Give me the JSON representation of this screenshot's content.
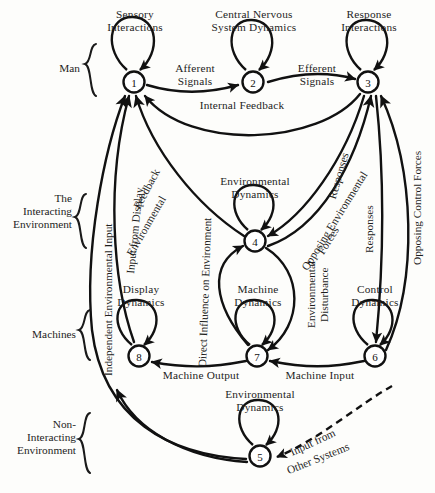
{
  "figure": {
    "type": "block-diagram",
    "background_color": "#fdfdfb",
    "line_color": "#111111"
  },
  "group_brackets": [
    {
      "id": "man",
      "label_lines": [
        "Man"
      ]
    },
    {
      "id": "interacting-environment",
      "label_lines": [
        "The",
        "Interacting",
        "Environment"
      ]
    },
    {
      "id": "machines",
      "label_lines": [
        "Machines"
      ]
    },
    {
      "id": "non-interacting-environment",
      "label_lines": [
        "Non-",
        "Interacting",
        "Environment"
      ]
    }
  ],
  "nodes": [
    {
      "id": 1,
      "number": "1",
      "title_lines": [
        "Sensory",
        "Interactions"
      ],
      "x": 134,
      "y": 82
    },
    {
      "id": 2,
      "number": "2",
      "title_lines": [
        "Central Nervous",
        "System Dynamics"
      ],
      "x": 253,
      "y": 82
    },
    {
      "id": 3,
      "number": "3",
      "title_lines": [
        "Response",
        "Interactions"
      ],
      "x": 368,
      "y": 82
    },
    {
      "id": 4,
      "number": "4",
      "title_lines": [
        "Environmental",
        "Dynamics"
      ],
      "x": 255,
      "y": 241
    },
    {
      "id": 5,
      "number": "5",
      "title_lines": [
        "Environmental",
        "Dynamics"
      ],
      "x": 260,
      "y": 456
    },
    {
      "id": 6,
      "number": "6",
      "title_lines": [
        "Control",
        "Dynamics"
      ],
      "x": 375,
      "y": 356
    },
    {
      "id": 7,
      "number": "7",
      "title_lines": [
        "Machine",
        "Dynamics"
      ],
      "x": 257,
      "y": 356
    },
    {
      "id": 8,
      "number": "8",
      "title_lines": [
        "Display",
        "Dynamics"
      ],
      "x": 139,
      "y": 356
    }
  ],
  "edge_labels": [
    {
      "id": "afferent-signals",
      "lines": [
        "Afferent",
        "Signals"
      ],
      "from": 1,
      "to": 2
    },
    {
      "id": "efferent-signals",
      "lines": [
        "Efferent",
        "Signals"
      ],
      "from": 2,
      "to": 3
    },
    {
      "id": "internal-feedback",
      "lines": [
        "Internal Feedback"
      ],
      "from": 3,
      "to": 1
    },
    {
      "id": "environmental-feedback",
      "lines": [
        "Environmental",
        "Feedback"
      ],
      "from": 4,
      "to": 1
    },
    {
      "id": "direct-influence-on-environment",
      "lines": [
        "Direct Influence on Environment"
      ],
      "from": 7,
      "to": 4
    },
    {
      "id": "responses-3-to-4",
      "lines": [
        "Responses"
      ],
      "from": 3,
      "to": 4
    },
    {
      "id": "opposing-environmental-forces",
      "lines": [
        "Opposing Environmental",
        "Forces"
      ],
      "from": 4,
      "to": 3
    },
    {
      "id": "responses-3-to-6",
      "lines": [
        "Responses"
      ],
      "from": 3,
      "to": 6
    },
    {
      "id": "opposing-control-forces",
      "lines": [
        "Opposing Control Forces"
      ],
      "from": 6,
      "to": 3
    },
    {
      "id": "independent-environmental-input",
      "lines": [
        "Independent Environmental Input"
      ],
      "from": 5,
      "to": 1
    },
    {
      "id": "input-from-display",
      "lines": [
        "Input from Display"
      ],
      "from": 8,
      "to": 1
    },
    {
      "id": "machine-output",
      "lines": [
        "Machine Output"
      ],
      "from": 7,
      "to": 8
    },
    {
      "id": "machine-input",
      "lines": [
        "Machine Input"
      ],
      "from": 6,
      "to": 7
    },
    {
      "id": "environmental-disturbance",
      "lines": [
        "Environmental",
        "Disturbance"
      ],
      "from": 4,
      "to": 7
    },
    {
      "id": "input-from-other-systems",
      "lines": [
        "Input from",
        "Other Systems"
      ],
      "from": "external",
      "to": 5
    }
  ],
  "self_loops": [
    {
      "node": 1,
      "label": "Sensory Interactions"
    },
    {
      "node": 2,
      "label": "Central Nervous System Dynamics"
    },
    {
      "node": 3,
      "label": "Response Interactions"
    },
    {
      "node": 4,
      "label": "Environmental Dynamics"
    },
    {
      "node": 5,
      "label": "Environmental Dynamics"
    },
    {
      "node": 6,
      "label": "Control Dynamics"
    },
    {
      "node": 7,
      "label": "Machine Dynamics"
    },
    {
      "node": 8,
      "label": "Display Dynamics"
    }
  ]
}
